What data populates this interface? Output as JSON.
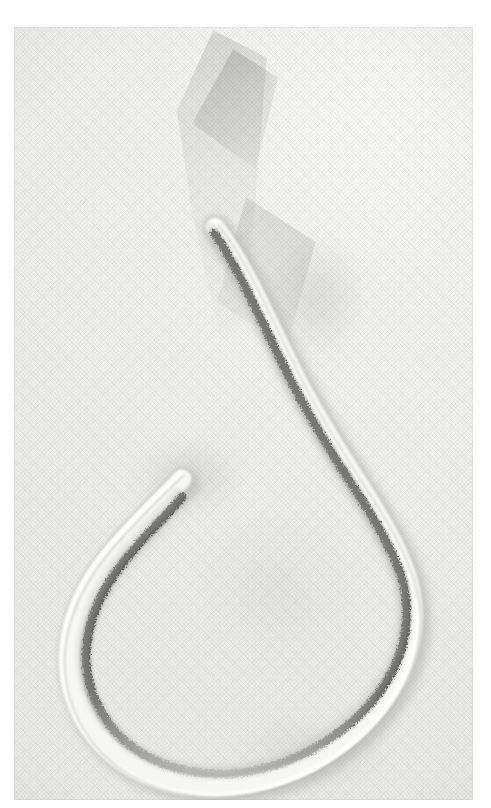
{
  "image": {
    "kind": "photograph",
    "subject": "coiled nematode-like worm specimen",
    "modality": "grayscale macro photograph / light micrograph",
    "orientation": "portrait",
    "width": 491,
    "height": 808,
    "plate": {
      "left": 14,
      "top": 27,
      "width": 459,
      "height": 773
    },
    "caption": ""
  },
  "palette": {
    "page_background": "#ffffff",
    "plate_background": "#f2f2f1",
    "paper_light": "#fbfbfa",
    "paper_mid": "#f1f1f0",
    "paper_shade": "#e6e6e4",
    "body_highlight": "#fdfdfc",
    "body_fill": "#f3f3f1",
    "body_edge": "#b9b9b6",
    "body_shadow": "#9d9d99",
    "gut_dark": "#3a3a38",
    "gut_darkest": "#242422",
    "gut_mid": "#6b6b67",
    "crystal_shadow": "#b0b0ae"
  },
  "specimen": {
    "name": "worm-specimen",
    "description": "Pale translucent elongate body looped into an open coil; a dark granular pigmented gut line runs along the inner margin of the body wall.",
    "parts": [
      {
        "name": "anterior-tip",
        "label": "anterior tip",
        "x": 201,
        "y": 196
      },
      {
        "name": "upper-limb",
        "label": "upper limb",
        "x": 262,
        "y": 300
      },
      {
        "name": "right-bend",
        "label": "right bend",
        "x": 382,
        "y": 588
      },
      {
        "name": "ventral-loop",
        "label": "ventral loop",
        "x": 220,
        "y": 752
      },
      {
        "name": "left-bend",
        "label": "left bend",
        "x": 70,
        "y": 560
      },
      {
        "name": "posterior-tip",
        "label": "posterior tip",
        "x": 168,
        "y": 435
      },
      {
        "name": "granular-gut-line",
        "label": "granular gut line",
        "x": 300,
        "y": 520
      }
    ],
    "body_width_px": 19,
    "gut_width_px": 7
  },
  "background_features": [
    {
      "name": "crystal-main",
      "label": "pale angular crystal shadow"
    },
    {
      "name": "crystal-facet",
      "label": "upper crystal facet"
    },
    {
      "name": "crystal-lower",
      "label": "lower crystal facet"
    },
    {
      "name": "shadow-right",
      "label": "soft right shadow"
    },
    {
      "name": "shadow-inner-loop",
      "label": "shadow inside loop"
    },
    {
      "name": "shadow-mid",
      "label": "broad central shading"
    },
    {
      "name": "shadow-bottom",
      "label": "shadow below ventral loop"
    },
    {
      "name": "cloth-weave",
      "label": "woven cloth texture"
    }
  ],
  "geometry": {
    "outline_path": "M 201 196 C 214 212 226 232 238 256 C 252 284 266 314 282 346 C 300 382 322 418 344 452 C 366 486 386 518 396 550 C 408 586 404 622 388 654 C 370 690 340 720 300 742 C 258 764 212 772 172 766 C 132 760 98 742 76 714 C 54 686 44 652 48 618 C 52 582 70 548 96 518 C 122 488 150 462 166 446",
    "midline_path": "M 201 200 C 213 216 225 236 237 259 C 251 287 265 317 281 349 C 299 384 321 420 343 454 C 364 487 383 518 393 549 C 404 583 400 618 385 649 C 367 684 338 713 299 734 C 258 756 213 763 175 757 C 137 751 104 734 83 707 C 62 680 53 648 57 616 C 61 582 78 550 103 521 C 128 492 154 468 168 452",
    "gut_path": "M 200 206 C 211 222 222 242 233 264 C 247 292 261 322 277 354 C 295 389 317 425 338 458 C 359 490 377 520 387 549 C 397 581 393 614 379 643 C 362 676 334 703 297 723 C 258 744 216 751 180 745 C 145 739 115 723 96 698 C 77 673 69 644 73 615 C 77 584 93 554 116 527 C 139 500 160 480 168 470"
  }
}
